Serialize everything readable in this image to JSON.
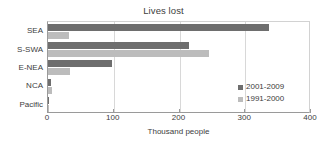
{
  "chart_data": {
    "type": "bar",
    "orientation": "horizontal",
    "title": "Lives lost",
    "xlabel": "Thousand people",
    "ylabel": "",
    "categories": [
      "SEA",
      "S-SWA",
      "E-NEA",
      "NCA",
      "Pacific"
    ],
    "series": [
      {
        "name": "2001-2009",
        "color": "#6e6e6e",
        "values": [
          336,
          214,
          97,
          4,
          2
        ]
      },
      {
        "name": "1991-2000",
        "color": "#bcbcbc",
        "values": [
          32,
          245,
          33,
          6,
          1
        ]
      }
    ],
    "xlim": [
      0,
      400
    ],
    "xticks": [
      0,
      100,
      200,
      300,
      400
    ],
    "grid": true,
    "gridlines_at": [
      100,
      200,
      300
    ],
    "legend_position": "inside-bottom-right",
    "legend_entries": [
      "2001-2009",
      "1991-2000"
    ]
  },
  "colors": {
    "series_recent": "#6e6e6e",
    "series_older": "#bcbcbc",
    "axis": "#9a9a9a",
    "grid": "#d8d8d8",
    "text": "#3d3d3d",
    "title_text": "#404040",
    "background": "#ffffff"
  }
}
